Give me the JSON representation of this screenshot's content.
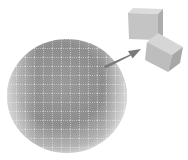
{
  "diagram": {
    "wafer": {
      "shape": "circle",
      "cx": 67,
      "cy": 96,
      "rx": 60,
      "ry": 57,
      "fill_light": "#d8d8d8",
      "fill_dark": "#8a8a8a",
      "grid_color": "#f2f2f2",
      "grid_spacing": 9
    },
    "arrow": {
      "from": [
        104,
        64
      ],
      "to": [
        140,
        49
      ],
      "color": "#7a7a7a"
    },
    "dies": [
      {
        "label": "die-1",
        "x": 128,
        "y": 8,
        "size": 30,
        "top": "#cfcfcf",
        "front": "#bdbdbd",
        "side": "#a9a9a9"
      },
      {
        "label": "die-2",
        "x": 147,
        "y": 34,
        "size": 32,
        "top": "#cdcdcd",
        "front": "#bbbbbb",
        "side": "#a5a5a5"
      }
    ]
  }
}
